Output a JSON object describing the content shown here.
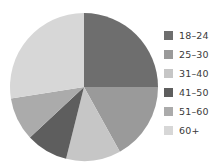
{
  "chart_data": {
    "type": "pie",
    "title": "",
    "subtitle": "",
    "xlabel": "",
    "ylabel": "",
    "grid": false,
    "legend_position": "right",
    "start_angle_deg": 0,
    "direction": "clockwise",
    "categories": [
      "18–24",
      "25–30",
      "31–40",
      "41–50",
      "51–60",
      "60+"
    ],
    "values": [
      25,
      17,
      12,
      9,
      9.5,
      27.5
    ],
    "value_unit": "percent",
    "colors": [
      "#6e6e6e",
      "#9a9a9a",
      "#c6c6c6",
      "#5e5e5e",
      "#ababab",
      "#d7d7d7"
    ],
    "slices": [
      {
        "label": "18–24",
        "value": 25,
        "color": "#6e6e6e",
        "start_deg": 0,
        "end_deg": 90
      },
      {
        "label": "25–30",
        "value": 17,
        "color": "#9a9a9a",
        "start_deg": 90,
        "end_deg": 151
      },
      {
        "label": "31–40",
        "value": 12,
        "color": "#c6c6c6",
        "start_deg": 151,
        "end_deg": 194
      },
      {
        "label": "41–50",
        "value": 9,
        "color": "#5e5e5e",
        "start_deg": 194,
        "end_deg": 227
      },
      {
        "label": "51–60",
        "value": 9.5,
        "color": "#ababab",
        "start_deg": 227,
        "end_deg": 261
      },
      {
        "label": "60+",
        "value": 27.5,
        "color": "#d7d7d7",
        "start_deg": 261,
        "end_deg": 360
      }
    ]
  },
  "legend": {
    "items": [
      {
        "label": "18–24",
        "color": "#6e6e6e"
      },
      {
        "label": "25–30",
        "color": "#9a9a9a"
      },
      {
        "label": "31–40",
        "color": "#c6c6c6"
      },
      {
        "label": "41–50",
        "color": "#5e5e5e"
      },
      {
        "label": "51–60",
        "color": "#ababab"
      },
      {
        "label": "60+",
        "color": "#d7d7d7"
      }
    ]
  }
}
